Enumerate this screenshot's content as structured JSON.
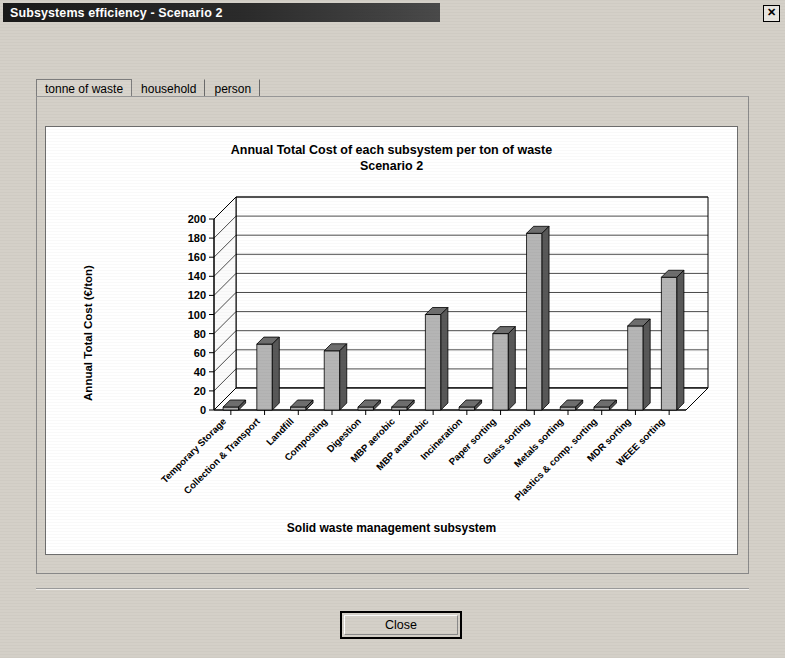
{
  "window": {
    "title": "Subsystems efficiency - Scenario 2",
    "close_box_glyph": "✕"
  },
  "tabs": [
    {
      "label": "tonne of waste",
      "selected": true
    },
    {
      "label": "household",
      "selected": false
    },
    {
      "label": "person",
      "selected": false
    }
  ],
  "footer": {
    "close_label": "Close"
  },
  "chart_data": {
    "type": "bar",
    "title": "Annual Total Cost of each subsystem per ton of waste",
    "subtitle": "Scenario 2",
    "xlabel": "Solid waste management subsystem",
    "ylabel": "Annual Total Cost (€/ton)",
    "ylim": [
      0,
      200
    ],
    "ytick_step": 20,
    "yticks": [
      0,
      20,
      40,
      60,
      80,
      100,
      120,
      140,
      160,
      180,
      200
    ],
    "grid": true,
    "legend": false,
    "three_d": true,
    "categories": [
      "Temporary Storage",
      "Collection & Transport",
      "Landfill",
      "Composting",
      "Digestion",
      "MBP aerobic",
      "MBP anaerobic",
      "Incineration",
      "Paper sorting",
      "Glass sorting",
      "Metals sorting",
      "Plastics & comp. sorting",
      "MDR sorting",
      "WEEE sorting"
    ],
    "values": [
      0,
      69,
      0,
      62,
      0,
      0,
      100,
      0,
      80,
      185,
      0,
      0,
      88,
      139
    ]
  }
}
